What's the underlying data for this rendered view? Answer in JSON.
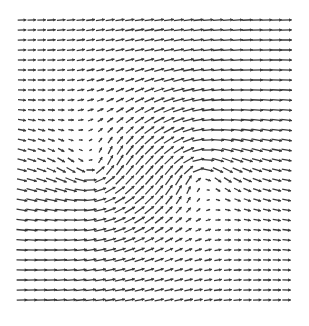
{
  "chart_data": {
    "type": "quiver",
    "title": "",
    "xlabel": "",
    "ylabel": "",
    "grid": false,
    "legend": null,
    "grid_spec": {
      "cols": 28,
      "rows": 29,
      "x0_px": 22,
      "y0_px": 20,
      "dx_px": 9.8,
      "dy_px": 10.0
    },
    "field": {
      "uniform_u": 1.0,
      "uniform_v": 0.0,
      "vortices": [
        {
          "cx_px": 95,
          "cy_px": 172,
          "strength": -900,
          "core": 22
        },
        {
          "cx_px": 200,
          "cy_px": 172,
          "strength": 900,
          "core": 22
        }
      ],
      "arrow_scale": 9.5,
      "max_len_px": 12
    },
    "style": {
      "arrow_color": "#3a3a3a",
      "background": "#ffffff",
      "stroke_width": 1.3
    }
  }
}
